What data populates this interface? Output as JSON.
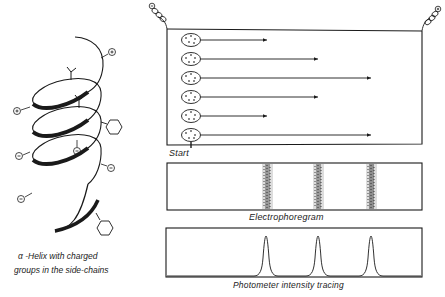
{
  "helix": {
    "caption_line1": "α -Helix with charged",
    "caption_line2": "groups in the side-chains",
    "charges": [
      {
        "sign": "+",
        "x": 112,
        "y": 52
      },
      {
        "sign": "+",
        "x": 17,
        "y": 111
      },
      {
        "sign": "−",
        "x": 77,
        "y": 151
      },
      {
        "sign": "−",
        "x": 111,
        "y": 168
      },
      {
        "sign": "−",
        "x": 19,
        "y": 156
      },
      {
        "sign": "−",
        "x": 21,
        "y": 199
      }
    ]
  },
  "electrophoresis": {
    "electrode_left": "⊖",
    "electrode_right": "⊕",
    "start_label": "Start",
    "migration_rows": [
      {
        "y": 40,
        "end_x": 267
      },
      {
        "y": 59,
        "end_x": 318
      },
      {
        "y": 78,
        "end_x": 371
      },
      {
        "y": 97,
        "end_x": 318
      },
      {
        "y": 116,
        "end_x": 267
      },
      {
        "y": 135,
        "end_x": 371
      }
    ]
  },
  "electrophoregram": {
    "label": "Electrophoregram",
    "band_positions_x": [
      267,
      318,
      371
    ]
  },
  "photometer": {
    "label": "Photometer intensity tracing",
    "peak_positions_x": [
      266,
      318,
      371
    ]
  },
  "colors": {
    "ink": "#1a1a1a",
    "background": "#ffffff"
  }
}
